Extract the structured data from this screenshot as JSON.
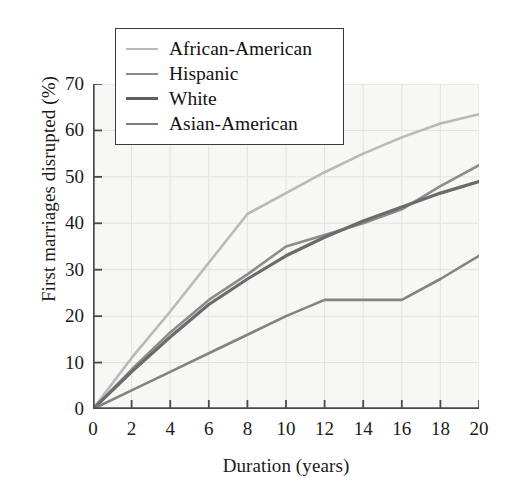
{
  "chart_data": {
    "type": "line",
    "title": "",
    "xlabel": "Duration (years)",
    "ylabel": "First marriages disrupted (%)",
    "xlim": [
      0,
      20
    ],
    "ylim": [
      0,
      70
    ],
    "xticks": [
      0,
      2,
      4,
      6,
      8,
      10,
      12,
      14,
      16,
      18,
      20
    ],
    "yticks": [
      0,
      10,
      20,
      30,
      40,
      50,
      60,
      70
    ],
    "grid": true,
    "legend_position": "top-left",
    "x": [
      0,
      2,
      4,
      6,
      8,
      10,
      12,
      14,
      16,
      18,
      20
    ],
    "series": [
      {
        "name": "African-American",
        "color": "#b9b9b9",
        "width": 2.6,
        "values": [
          0,
          11,
          21,
          31.5,
          42,
          46.5,
          51,
          55,
          58.5,
          61.5,
          63.5
        ]
      },
      {
        "name": "Hispanic",
        "color": "#8c8c8c",
        "width": 2.6,
        "values": [
          0,
          8.5,
          16.5,
          23.5,
          29,
          35,
          37.5,
          40,
          43,
          48,
          52.5
        ]
      },
      {
        "name": "White",
        "color": "#6b6b6b",
        "width": 3.2,
        "values": [
          0,
          8,
          15.5,
          22.5,
          28,
          33,
          37,
          40.5,
          43.5,
          46.5,
          49
        ]
      },
      {
        "name": "Asian-American",
        "color": "#828282",
        "width": 2.6,
        "values": [
          0,
          4,
          8,
          12,
          16,
          20,
          23.5,
          23.5,
          23.5,
          28,
          33
        ]
      }
    ]
  },
  "legend": {
    "items": [
      {
        "label": "African-American",
        "color": "#b9b9b9",
        "width": 2.6
      },
      {
        "label": "Hispanic",
        "color": "#8c8c8c",
        "width": 2.8
      },
      {
        "label": "White",
        "color": "#5f5f5f",
        "width": 3.6
      },
      {
        "label": "Asian-American",
        "color": "#7e7e7e",
        "width": 2.8
      }
    ]
  },
  "axes": {
    "y_title": "First marriages disrupted (%)",
    "x_title": "Duration (years)",
    "y_tick_labels": [
      "70",
      "60",
      "50",
      "40",
      "30",
      "20",
      "10",
      "0"
    ],
    "x_tick_labels": [
      "0",
      "2",
      "4",
      "6",
      "8",
      "10",
      "12",
      "14",
      "16",
      "18",
      "20"
    ]
  },
  "colors": {
    "plot_background": "#f7f7f5",
    "grid": "#e2e2de",
    "axis": "#4a4a4a",
    "text": "#1a1a1a"
  }
}
